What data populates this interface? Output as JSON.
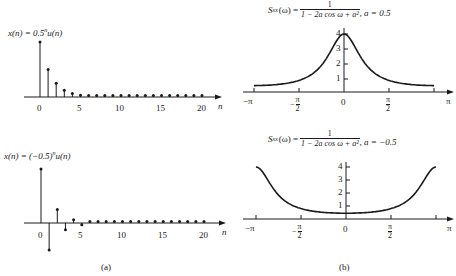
{
  "chart_data": [
    {
      "type": "stem",
      "panel": "a-top",
      "title": "x(n) = 0.5^n u(n)",
      "xlabel": "n",
      "ylabel": "",
      "x_ticks": [
        "0",
        "5",
        "10",
        "15",
        "20"
      ],
      "x": [
        0,
        1,
        2,
        3,
        4,
        5,
        6,
        7,
        8,
        9,
        10,
        11,
        12,
        13,
        14,
        15,
        16,
        17,
        18,
        19,
        20
      ],
      "values": [
        1,
        0.5,
        0.25,
        0.125,
        0.0625,
        0.03125,
        0.0156,
        0.0078,
        0.0039,
        0.002,
        0.001,
        0,
        0,
        0,
        0,
        0,
        0,
        0,
        0,
        0,
        0
      ],
      "xlim": [
        -2,
        22
      ],
      "grid": false
    },
    {
      "type": "stem",
      "panel": "a-bottom",
      "title": "x(n) = (-0.5)^n u(n)",
      "xlabel": "n",
      "ylabel": "",
      "x_ticks": [
        "0",
        "5",
        "10",
        "15",
        "20"
      ],
      "x": [
        0,
        1,
        2,
        3,
        4,
        5,
        6,
        7,
        8,
        9,
        10,
        11,
        12,
        13,
        14,
        15,
        16,
        17,
        18,
        19,
        20
      ],
      "values": [
        1,
        -0.5,
        0.25,
        -0.125,
        0.0625,
        -0.03125,
        0.0156,
        -0.0078,
        0.0039,
        -0.002,
        0.001,
        0,
        0,
        0,
        0,
        0,
        0,
        0,
        0,
        0,
        0
      ],
      "xlim": [
        -2,
        22
      ],
      "grid": false
    },
    {
      "type": "line",
      "panel": "b-top",
      "title": "S_xx(ω) = 1 / (1 − 2a cos ω + a²), a = 0.5",
      "xlabel": "",
      "ylabel": "",
      "x_ticks": [
        "−π",
        "−π/2",
        "0",
        "π/2",
        "π"
      ],
      "y_ticks": [
        "1",
        "2",
        "3",
        "4"
      ],
      "parameter_a": 0.5,
      "x": [
        -3.1416,
        -2.3562,
        -1.5708,
        -0.7854,
        0,
        0.7854,
        1.5708,
        2.3562,
        3.1416
      ],
      "values": [
        0.444,
        0.512,
        0.8,
        1.67,
        4.0,
        1.67,
        0.8,
        0.512,
        0.444
      ],
      "xlim": [
        -3.1416,
        3.1416
      ],
      "ylim": [
        0,
        4.3
      ],
      "grid": false
    },
    {
      "type": "line",
      "panel": "b-bottom",
      "title": "S_xx(ω) = 1 / (1 − 2a cos ω + a²), a = −0.5",
      "xlabel": "",
      "ylabel": "",
      "x_ticks": [
        "−π",
        "−π/2",
        "0",
        "π/2",
        "π"
      ],
      "y_ticks": [
        "1",
        "2",
        "3",
        "4"
      ],
      "parameter_a": -0.5,
      "x": [
        -3.1416,
        -2.3562,
        -1.5708,
        -0.7854,
        0,
        0.7854,
        1.5708,
        2.3562,
        3.1416
      ],
      "values": [
        4.0,
        1.67,
        0.8,
        0.512,
        0.444,
        0.512,
        0.8,
        1.67,
        4.0
      ],
      "xlim": [
        -3.1416,
        3.1416
      ],
      "ylim": [
        0,
        4.3
      ],
      "grid": false
    }
  ],
  "labels": {
    "a_top_lhs": "x(n) = 0.5",
    "a_top_exp": "n",
    "a_top_rhs": "u(n)",
    "a_bottom_lhs": "x(n) = (−0.5)",
    "a_bottom_exp": "n",
    "a_bottom_rhs": "u(n)",
    "b_lhs": "S",
    "b_sub": "xx",
    "b_arg": "(ω) =",
    "b_num": "1",
    "b_den": "1 − 2a cos ω + a²",
    "b_top_param": ", a = 0.5",
    "b_bottom_param": ", a = −0.5",
    "n_axis": "n",
    "n_ticks": [
      "0",
      "5",
      "10",
      "15",
      "20"
    ],
    "w_ticks": [
      "−π",
      "−",
      "0",
      "",
      "π"
    ],
    "pi": "π",
    "two": "2",
    "y_ticks": [
      "1",
      "2",
      "3",
      "4"
    ],
    "caption_a": "(a)",
    "caption_b": "(b)"
  }
}
